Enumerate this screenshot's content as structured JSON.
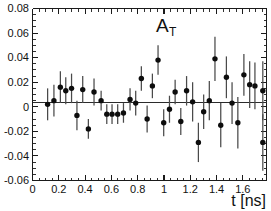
{
  "chart_data": {
    "type": "scatter",
    "title": "A",
    "title_subscript": "T",
    "xlabel": "t [ns]",
    "ylabel": "",
    "xlim": [
      0,
      1.78
    ],
    "ylim": [
      -0.06,
      0.08
    ],
    "grid": false,
    "legend": null,
    "xticks": [
      0,
      0.2,
      0.4,
      0.6,
      0.8,
      1,
      1.2,
      1.4,
      1.6
    ],
    "xticklabels": [
      "0",
      "0.2",
      "0.4",
      "0.6",
      "0.8",
      "1",
      "1.2",
      "1.4",
      "1.6"
    ],
    "yticks": [
      -0.06,
      -0.04,
      -0.02,
      0,
      0.02,
      0.04,
      0.06,
      0.08
    ],
    "yticklabels": [
      "-0.06",
      "-0.04",
      "-0.02",
      "0",
      "0.02",
      "0.04",
      "0.06",
      "0.08"
    ],
    "x_minor_tick_step": 0.05,
    "y_minor_tick_step": 0.005,
    "fit_line": {
      "type": "horizontal",
      "value": 0.0035,
      "label": "constant fit"
    },
    "series": [
      {
        "name": "A_T measurement",
        "marker": "filled-circle",
        "marker_color": "#0d0d0d",
        "errorbar_color": "#4a4a4a",
        "x": [
          0.115,
          0.163,
          0.212,
          0.253,
          0.297,
          0.338,
          0.382,
          0.425,
          0.468,
          0.522,
          0.565,
          0.605,
          0.648,
          0.692,
          0.742,
          0.785,
          0.828,
          0.872,
          0.912,
          0.955,
          0.998,
          1.042,
          1.085,
          1.128,
          1.172,
          1.218,
          1.262,
          1.302,
          1.345,
          1.388,
          1.432,
          1.475,
          1.518,
          1.562,
          1.608,
          1.652,
          1.692,
          1.752
        ],
        "y": [
          0.002,
          0.005,
          0.016,
          0.013,
          0.015,
          -0.007,
          0.014,
          -0.018,
          0.012,
          0.005,
          -0.006,
          -0.006,
          -0.006,
          -0.005,
          0.006,
          0.003,
          0.023,
          -0.01,
          0.017,
          0.038,
          -0.013,
          -0.002,
          0.012,
          -0.012,
          0.013,
          0.004,
          -0.029,
          -0.004,
          0.005,
          0.039,
          -0.015,
          0.024,
          0.003,
          -0.013,
          0.026,
          0.018,
          0.017,
          0.013
        ],
        "yerr": [
          0.013,
          0.013,
          0.013,
          0.011,
          0.012,
          0.012,
          0.011,
          0.008,
          0.011,
          0.008,
          0.008,
          0.008,
          0.008,
          0.008,
          0.009,
          0.01,
          0.01,
          0.011,
          0.01,
          0.012,
          0.011,
          0.011,
          0.01,
          0.011,
          0.012,
          0.016,
          0.016,
          0.014,
          0.016,
          0.018,
          0.018,
          0.017,
          0.017,
          0.021,
          0.017,
          0.019,
          0.019,
          0.024
        ]
      },
      {
        "name": "A_T measurement tail",
        "marker": "filled-circle",
        "marker_color": "#0d0d0d",
        "errorbar_color": "#4a4a4a",
        "x": [
          1.752
        ],
        "y": [
          -0.029
        ],
        "yerr": [
          0.023
        ]
      }
    ]
  },
  "figure": {
    "background_color": "#ffffff",
    "axis_color": "#1a1a1a",
    "marker_color": "#0d0d0d",
    "errorbar_color": "#4a4a4a",
    "fitline_color": "#2b2b2b"
  }
}
